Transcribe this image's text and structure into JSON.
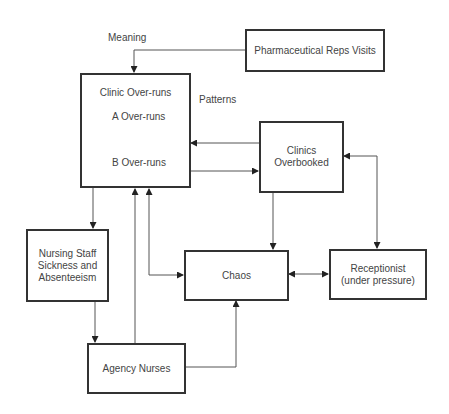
{
  "diagram": {
    "labels": {
      "meaning": "Meaning",
      "patterns": "Patterns"
    },
    "nodes": {
      "pharma": "Pharmaceutical Reps Visits",
      "clinic_overruns": {
        "title": "Clinic Over-runs",
        "loop_a": "A Over-runs",
        "loop_b": "B Over-runs"
      },
      "clinics_overbooked": "Clinics\nOverbooked",
      "nursing": "Nursing Staff\nSickness and\nAbsenteeism",
      "chaos": "Chaos",
      "receptionist": "Receptionist\n(under pressure)",
      "agency": "Agency Nurses"
    },
    "edges": [
      {
        "from": "Pharmaceutical Reps Visits",
        "to": "Clinic Over-runs"
      },
      {
        "from": "Clinics Overbooked",
        "to": "Clinic Over-runs"
      },
      {
        "from": "Clinic Over-runs",
        "to": "Clinics Overbooked"
      },
      {
        "from": "Clinic Over-runs",
        "to": "Nursing Staff Sickness and Absenteeism"
      },
      {
        "from": "Clinic Over-runs",
        "to": "Chaos",
        "bidirectional": true
      },
      {
        "from": "Agency Nurses",
        "to": "Clinic Over-runs"
      },
      {
        "from": "Clinics Overbooked",
        "to": "Chaos"
      },
      {
        "from": "Clinics Overbooked",
        "to": "Receptionist (under pressure)",
        "bidirectional": true
      },
      {
        "from": "Chaos",
        "to": "Receptionist (under pressure)",
        "bidirectional": true
      },
      {
        "from": "Nursing Staff Sickness and Absenteeism",
        "to": "Agency Nurses"
      },
      {
        "from": "Agency Nurses",
        "to": "Chaos"
      }
    ]
  }
}
